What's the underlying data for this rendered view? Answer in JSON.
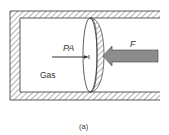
{
  "figure": {
    "caption": "(a)",
    "labels": {
      "pressure_force": "PA",
      "external_force": "F",
      "gas": "Gas"
    },
    "colors": {
      "line": "#333333",
      "hatch": "#555555",
      "force_arrow_fill": "#8c8c8c",
      "force_arrow_stroke": "#555555",
      "background": "#ffffff"
    }
  }
}
